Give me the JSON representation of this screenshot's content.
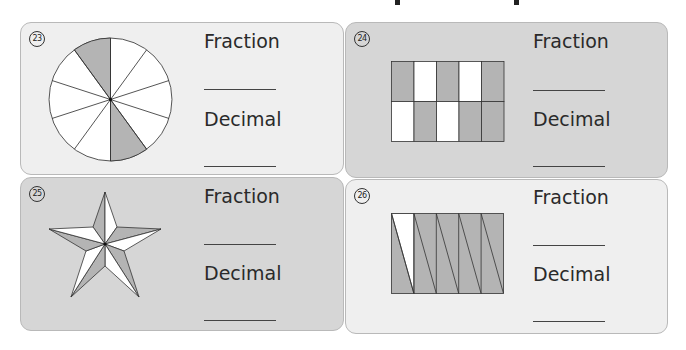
{
  "page": {
    "colors": {
      "shade": "#b4b4b4",
      "white": "#ffffff",
      "panel_light": "#efefef",
      "panel_dark": "#d6d6d6",
      "stroke": "#333333"
    }
  },
  "problems": [
    {
      "number": "23",
      "fraction_label": "Fraction",
      "decimal_label": "Decimal",
      "fraction_answer": "",
      "decimal_answer": "",
      "shape": "circle",
      "parts": 10,
      "shaded": 2
    },
    {
      "number": "24",
      "fraction_label": "Fraction",
      "decimal_label": "Decimal",
      "fraction_answer": "",
      "decimal_answer": "",
      "shape": "grid 2x5",
      "parts": 10,
      "shaded": 6
    },
    {
      "number": "25",
      "fraction_label": "Fraction",
      "decimal_label": "Decimal",
      "fraction_answer": "",
      "decimal_answer": "",
      "shape": "star",
      "parts": 10,
      "shaded": 5
    },
    {
      "number": "26",
      "fraction_label": "Fraction",
      "decimal_label": "Decimal",
      "fraction_answer": "",
      "decimal_answer": "",
      "shape": "rectangle with triangles",
      "parts": 10,
      "shaded": 9
    }
  ]
}
